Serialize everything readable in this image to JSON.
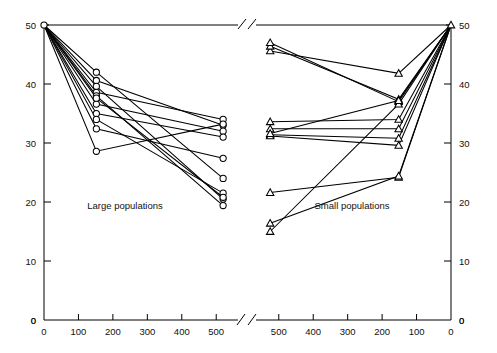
{
  "figure": {
    "background": "#ffffff",
    "line_color": "#000000",
    "marker_open_fill": "#ffffff"
  },
  "chart_data": {
    "type": "line",
    "title": "",
    "xlabel": "",
    "ylabel": "",
    "ylim": [
      0,
      50
    ],
    "grid": false,
    "legend": "none",
    "axis_break": true,
    "panels": [
      {
        "name": "left-panel",
        "caption": "Large populations",
        "marker": "circle",
        "x_ticks": [
          0,
          100,
          200,
          300,
          400,
          500
        ],
        "x_tick_labels": [
          "0",
          "100",
          "200",
          "300",
          "400",
          "500"
        ],
        "x_direction": "increasing",
        "xlim": [
          0,
          540
        ],
        "y_ticks": [
          0,
          10,
          20,
          30,
          40,
          50
        ],
        "y_tick_labels": [
          "0",
          "10",
          "20",
          "30",
          "40",
          "50"
        ],
        "y_axis_side": "left",
        "series": [
          {
            "name": "L1",
            "x": [
              0,
              152,
              520
            ],
            "values": [
              50,
              42.0,
              24.0
            ]
          },
          {
            "name": "L2",
            "x": [
              0,
              152,
              520
            ],
            "values": [
              50,
              40.6,
              33.0
            ]
          },
          {
            "name": "L3",
            "x": [
              0,
              152,
              520
            ],
            "values": [
              50,
              39.6,
              20.5
            ]
          },
          {
            "name": "L4",
            "x": [
              0,
              152,
              520
            ],
            "values": [
              50,
              38.6,
              34.0
            ]
          },
          {
            "name": "L5",
            "x": [
              0,
              152,
              520
            ],
            "values": [
              50,
              38.0,
              19.4
            ]
          },
          {
            "name": "L6",
            "x": [
              0,
              152,
              520
            ],
            "values": [
              50,
              36.6,
              32.0
            ]
          },
          {
            "name": "L7",
            "x": [
              0,
              152,
              520
            ],
            "values": [
              50,
              35.0,
              31.0
            ]
          },
          {
            "name": "L8",
            "x": [
              0,
              152,
              520
            ],
            "values": [
              50,
              34.0,
              21.5
            ]
          },
          {
            "name": "L9",
            "x": [
              0,
              152,
              520
            ],
            "values": [
              50,
              32.4,
              27.4
            ]
          },
          {
            "name": "L10",
            "x": [
              0,
              152,
              520
            ],
            "values": [
              50,
              28.6,
              33.2
            ]
          },
          {
            "name": "L11",
            "x": [
              0,
              152,
              520
            ],
            "values": [
              50,
              37.6,
              20.8
            ]
          }
        ]
      },
      {
        "name": "right-panel",
        "caption": "Small populations",
        "marker": "triangle",
        "x_ticks": [
          500,
          400,
          300,
          200,
          100,
          0
        ],
        "x_tick_labels": [
          "500",
          "400",
          "300",
          "200",
          "100",
          "0"
        ],
        "x_direction": "decreasing",
        "xlim": [
          540,
          0
        ],
        "y_ticks": [
          0,
          10,
          20,
          30,
          40,
          50
        ],
        "y_tick_labels": [
          "0",
          "10",
          "20",
          "30",
          "40",
          "50"
        ],
        "y_axis_side": "right",
        "series": [
          {
            "name": "S1",
            "x": [
              0,
              152,
              525
            ],
            "values": [
              50,
              41.8,
              45.6
            ]
          },
          {
            "name": "S2",
            "x": [
              0,
              152,
              525
            ],
            "values": [
              50,
              37.4,
              46.4
            ]
          },
          {
            "name": "S3",
            "x": [
              0,
              152,
              525
            ],
            "values": [
              50,
              37.0,
              47.0
            ]
          },
          {
            "name": "S4",
            "x": [
              0,
              152,
              525
            ],
            "values": [
              50,
              34.0,
              33.6
            ]
          },
          {
            "name": "S5",
            "x": [
              0,
              152,
              525
            ],
            "values": [
              50,
              32.4,
              32.4
            ]
          },
          {
            "name": "S6",
            "x": [
              0,
              152,
              525
            ],
            "values": [
              50,
              30.8,
              31.4
            ]
          },
          {
            "name": "S7",
            "x": [
              0,
              152,
              525
            ],
            "values": [
              50,
              29.6,
              31.2
            ]
          },
          {
            "name": "S8",
            "x": [
              0,
              152,
              525
            ],
            "values": [
              50,
              24.2,
              21.6
            ]
          },
          {
            "name": "S9",
            "x": [
              0,
              152,
              525
            ],
            "values": [
              50,
              24.4,
              16.4
            ]
          },
          {
            "name": "S10",
            "x": [
              0,
              152,
              525
            ],
            "values": [
              50,
              36.6,
              15.0
            ]
          },
          {
            "name": "S11",
            "x": [
              0,
              152,
              525
            ],
            "values": [
              50,
              37.2,
              31.6
            ]
          }
        ]
      }
    ]
  },
  "labels": {
    "left_caption": "Large populations",
    "right_caption": "Small populations",
    "left_y": [
      "50",
      "40",
      "30",
      "20",
      "10",
      "0"
    ],
    "right_y": [
      "50",
      "40",
      "30",
      "20",
      "10",
      "0"
    ],
    "left_x": [
      "0",
      "100",
      "200",
      "300",
      "400",
      "500"
    ],
    "right_x": [
      "500",
      "400",
      "300",
      "200",
      "100",
      "0"
    ],
    "left_origin_corner": "0",
    "right_origin_corner": "0"
  }
}
